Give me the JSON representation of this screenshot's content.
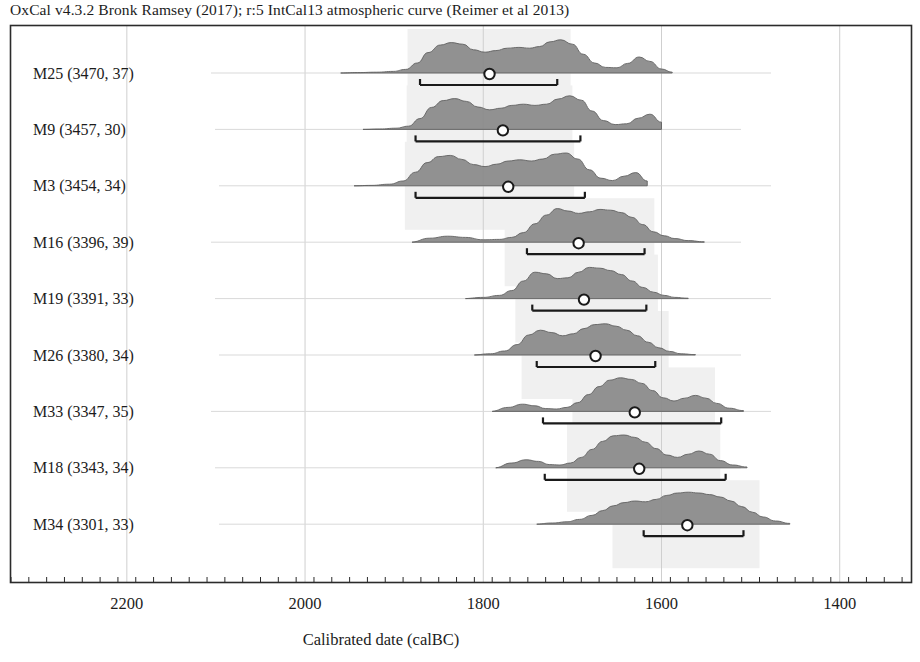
{
  "header": {
    "credit": "OxCal v4.3.2 Bronk Ramsey (2017); r:5 IntCal13 atmospheric curve (Reimer et al 2013)"
  },
  "axis": {
    "title": "Calibrated date (calBC)",
    "tick_labels": [
      "2200",
      "2000",
      "1800",
      "1600",
      "1400"
    ]
  },
  "labels": {
    "m25": "M25 (3470, 37)",
    "m9": "M9 (3457, 30)",
    "m3": "M3 (3454, 34)",
    "m16": "M16 (3396, 39)",
    "m19": "M19 (3391, 33)",
    "m26": "M26 (3380, 34)",
    "m33": "M33 (3347, 35)",
    "m18": "M18 (3343, 34)",
    "m34": "M34 (3301, 33)"
  },
  "colors": {
    "distribution_fill": "#8c8c8c",
    "distribution_stroke": "#5a5a5a",
    "highlight_band": "#f0f0f0",
    "frame": "#2b2b2b",
    "gridline": "#cfcfcf",
    "baseline": "#d9d9d9",
    "marker_stroke": "#1a1a1a",
    "marker_fill": "#ffffff",
    "text": "#1c1c1c"
  },
  "chart_data": {
    "type": "area",
    "title": "OxCal v4.3.2 Bronk Ramsey (2017); r:5 IntCal13 atmospheric curve (Reimer et al 2013)",
    "xlabel": "Calibrated date (calBC)",
    "ylabel": "",
    "grid": true,
    "legend": "none",
    "x_axis": {
      "unit": "calBC",
      "direction": "decreasing",
      "ticks_major": [
        2200,
        2000,
        1800,
        1600,
        1400
      ],
      "tick_interval_minor": 20,
      "xlim_calBC": [
        2330,
        1320
      ]
    },
    "series": [
      {
        "name": "M25 (3470, 37)",
        "bp_mean": 3470,
        "bp_sigma": 37,
        "median_calBC": 1793,
        "range_calBC": [
          1871,
          1717
        ],
        "band_calBC": [
          1885,
          1702
        ],
        "curve_calBC": [
          1960,
          1941,
          1920,
          1901,
          1887,
          1874,
          1862,
          1848,
          1836,
          1823,
          1811,
          1798,
          1786,
          1773,
          1760,
          1748,
          1737,
          1725,
          1713,
          1700,
          1688,
          1675,
          1663,
          1650,
          1638,
          1625,
          1613,
          1600,
          1588
        ],
        "curve_density": [
          0.0,
          0.01,
          0.02,
          0.04,
          0.09,
          0.25,
          0.51,
          0.7,
          0.76,
          0.72,
          0.58,
          0.52,
          0.56,
          0.62,
          0.64,
          0.62,
          0.66,
          0.78,
          0.83,
          0.72,
          0.47,
          0.25,
          0.14,
          0.13,
          0.24,
          0.4,
          0.29,
          0.1,
          0.02
        ]
      },
      {
        "name": "M9 (3457, 30)",
        "bp_mean": 3457,
        "bp_sigma": 30,
        "median_calBC": 1778,
        "range_calBC": [
          1876,
          1691
        ],
        "band_calBC": [
          1886,
          1700
        ],
        "curve_calBC": [
          1935,
          1916,
          1898,
          1884,
          1871,
          1858,
          1845,
          1832,
          1819,
          1806,
          1793,
          1780,
          1768,
          1755,
          1742,
          1729,
          1716,
          1703,
          1690,
          1678,
          1665,
          1652,
          1639,
          1626,
          1613,
          1600
        ],
        "curve_density": [
          0.0,
          0.01,
          0.03,
          0.08,
          0.27,
          0.55,
          0.72,
          0.77,
          0.7,
          0.56,
          0.49,
          0.53,
          0.6,
          0.63,
          0.6,
          0.63,
          0.76,
          0.84,
          0.73,
          0.46,
          0.22,
          0.12,
          0.14,
          0.28,
          0.38,
          0.18
        ]
      },
      {
        "name": "M3 (3454, 34)",
        "bp_mean": 3454,
        "bp_sigma": 34,
        "median_calBC": 1772,
        "range_calBC": [
          1876,
          1686
        ],
        "band_calBC": [
          1888,
          1698
        ],
        "curve_calBC": [
          1945,
          1926,
          1905,
          1890,
          1876,
          1863,
          1850,
          1837,
          1824,
          1811,
          1798,
          1785,
          1772,
          1759,
          1746,
          1733,
          1720,
          1707,
          1694,
          1681,
          1668,
          1655,
          1642,
          1629,
          1616
        ],
        "curve_density": [
          0.0,
          0.01,
          0.04,
          0.12,
          0.34,
          0.58,
          0.73,
          0.76,
          0.66,
          0.53,
          0.48,
          0.54,
          0.62,
          0.65,
          0.62,
          0.67,
          0.79,
          0.82,
          0.67,
          0.4,
          0.19,
          0.13,
          0.24,
          0.33,
          0.12
        ]
      },
      {
        "name": "M16 (3396, 39)",
        "bp_mean": 3396,
        "bp_sigma": 39,
        "median_calBC": 1693,
        "range_calBC": [
          1751,
          1619
        ],
        "band_calBC": [
          1776,
          1608
        ],
        "curve_calBC": [
          1880,
          1860,
          1840,
          1820,
          1800,
          1782,
          1768,
          1755,
          1742,
          1729,
          1717,
          1705,
          1693,
          1681,
          1669,
          1657,
          1645,
          1633,
          1621,
          1609,
          1597,
          1585,
          1570,
          1552
        ],
        "curve_density": [
          0.02,
          0.1,
          0.15,
          0.12,
          0.06,
          0.07,
          0.12,
          0.24,
          0.46,
          0.68,
          0.84,
          0.78,
          0.72,
          0.76,
          0.82,
          0.8,
          0.74,
          0.62,
          0.44,
          0.26,
          0.16,
          0.09,
          0.04,
          0.01
        ]
      },
      {
        "name": "M19 (3391, 33)",
        "bp_mean": 3391,
        "bp_sigma": 33,
        "median_calBC": 1687,
        "range_calBC": [
          1745,
          1617
        ],
        "band_calBC": [
          1764,
          1604
        ],
        "curve_calBC": [
          1820,
          1800,
          1782,
          1768,
          1755,
          1742,
          1729,
          1717,
          1705,
          1693,
          1681,
          1669,
          1657,
          1645,
          1633,
          1621,
          1609,
          1597,
          1585,
          1570
        ],
        "curve_density": [
          0.01,
          0.03,
          0.08,
          0.2,
          0.44,
          0.66,
          0.62,
          0.5,
          0.52,
          0.66,
          0.78,
          0.76,
          0.7,
          0.6,
          0.44,
          0.28,
          0.16,
          0.08,
          0.03,
          0.01
        ]
      },
      {
        "name": "M26 (3380, 34)",
        "bp_mean": 3380,
        "bp_sigma": 34,
        "median_calBC": 1674,
        "range_calBC": [
          1740,
          1607
        ],
        "band_calBC": [
          1757,
          1592
        ],
        "curve_calBC": [
          1810,
          1792,
          1776,
          1762,
          1749,
          1736,
          1723,
          1711,
          1699,
          1687,
          1675,
          1663,
          1651,
          1639,
          1627,
          1615,
          1603,
          1591,
          1578,
          1562
        ],
        "curve_density": [
          0.01,
          0.03,
          0.1,
          0.26,
          0.5,
          0.62,
          0.56,
          0.48,
          0.53,
          0.66,
          0.76,
          0.78,
          0.72,
          0.62,
          0.48,
          0.32,
          0.18,
          0.09,
          0.03,
          0.01
        ]
      },
      {
        "name": "M33 (3347, 35)",
        "bp_mean": 3347,
        "bp_sigma": 35,
        "median_calBC": 1630,
        "range_calBC": [
          1733,
          1533
        ],
        "band_calBC": [
          1700,
          1540
        ],
        "curve_calBC": [
          1790,
          1772,
          1756,
          1742,
          1730,
          1718,
          1706,
          1694,
          1682,
          1670,
          1658,
          1646,
          1634,
          1622,
          1610,
          1598,
          1586,
          1574,
          1562,
          1550,
          1538,
          1524,
          1508
        ],
        "curve_density": [
          0.02,
          0.1,
          0.18,
          0.14,
          0.07,
          0.06,
          0.1,
          0.22,
          0.42,
          0.62,
          0.78,
          0.84,
          0.8,
          0.7,
          0.52,
          0.34,
          0.26,
          0.33,
          0.4,
          0.33,
          0.2,
          0.08,
          0.02
        ]
      },
      {
        "name": "M18 (3343, 34)",
        "bp_mean": 3343,
        "bp_sigma": 34,
        "median_calBC": 1625,
        "range_calBC": [
          1731,
          1528
        ],
        "band_calBC": [
          1706,
          1534
        ],
        "curve_calBC": [
          1786,
          1768,
          1752,
          1738,
          1726,
          1714,
          1702,
          1690,
          1678,
          1666,
          1654,
          1642,
          1630,
          1618,
          1606,
          1594,
          1582,
          1570,
          1558,
          1546,
          1534,
          1520,
          1504
        ],
        "curve_density": [
          0.02,
          0.12,
          0.2,
          0.16,
          0.08,
          0.07,
          0.12,
          0.26,
          0.46,
          0.66,
          0.8,
          0.82,
          0.76,
          0.64,
          0.48,
          0.32,
          0.26,
          0.34,
          0.42,
          0.34,
          0.18,
          0.07,
          0.02
        ]
      },
      {
        "name": "M34 (3301, 33)",
        "bp_mean": 3301,
        "bp_sigma": 33,
        "median_calBC": 1571,
        "range_calBC": [
          1620,
          1508
        ],
        "band_calBC": [
          1655,
          1490
        ],
        "curve_calBC": [
          1740,
          1722,
          1706,
          1692,
          1678,
          1666,
          1654,
          1642,
          1630,
          1618,
          1606,
          1594,
          1582,
          1570,
          1558,
          1546,
          1534,
          1522,
          1510,
          1498,
          1486,
          1472,
          1456
        ],
        "curve_density": [
          0.01,
          0.03,
          0.06,
          0.12,
          0.22,
          0.34,
          0.46,
          0.54,
          0.58,
          0.56,
          0.62,
          0.72,
          0.78,
          0.8,
          0.78,
          0.74,
          0.68,
          0.58,
          0.44,
          0.3,
          0.18,
          0.08,
          0.02
        ]
      }
    ]
  }
}
